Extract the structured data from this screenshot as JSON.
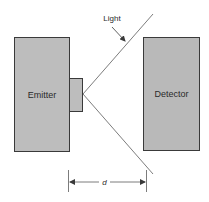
{
  "diagram": {
    "emitter": {
      "label": "Emitter",
      "fill": "#bdbdbd",
      "stroke": "#3a3a3a"
    },
    "detector": {
      "label": "Detector",
      "fill": "#b9b9b9",
      "stroke": "#3a3a3a"
    },
    "light_label": "Light",
    "distance_label": "d",
    "line_color": "#5a5a5a"
  }
}
